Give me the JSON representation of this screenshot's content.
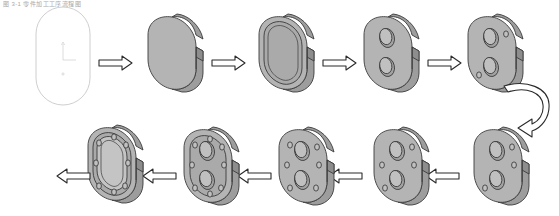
{
  "caption": {
    "text": "图 3-1 零件加工工序流程图"
  },
  "colors": {
    "face": "#b4b4b4",
    "face_light": "#c9c9c9",
    "side": "#9a9a9a",
    "side_dark": "#8a8a8a",
    "pocket": "#a8a8a8",
    "hole": "#bdbdbd",
    "outline": "#3a3a3a",
    "wireframe": "#c8c8c8",
    "arrow_fill": "#ffffff",
    "arrow_stroke": "#2b2b2b",
    "background": "#ffffff"
  },
  "diagram": {
    "type": "process-flow",
    "title": "零件加工工序流程图",
    "flow_direction": "serpentine-right-then-left",
    "step_count": 10,
    "rows": [
      {
        "name": "top-row",
        "direction": "left-to-right",
        "steps": [
          {
            "index": 1,
            "id": "step-sketch",
            "label": "毛坯草图轮廓",
            "kind": "wireframe-outline",
            "features": "stadium outline with datum axis marker"
          },
          {
            "index": 2,
            "id": "step-blank",
            "label": "拉伸成形坯料",
            "kind": "solid-extrusion",
            "features": "solid obround block"
          },
          {
            "index": 3,
            "id": "step-pocket",
            "label": "铣削内腔",
            "kind": "pocket",
            "features": "recessed inner obround pocket"
          },
          {
            "index": 4,
            "id": "step-two-bores",
            "label": "钻两大孔",
            "kind": "bored",
            "features": "two large through bores"
          },
          {
            "index": 5,
            "id": "step-two-small",
            "label": "钻两小孔",
            "kind": "bored-small",
            "features": "two large bores plus two small holes"
          }
        ]
      },
      {
        "name": "bottom-row",
        "direction": "right-to-left",
        "steps": [
          {
            "index": 6,
            "id": "step-three-small",
            "label": "增钻小孔",
            "kind": "bored-small",
            "features": "two large bores plus three small holes"
          },
          {
            "index": 7,
            "id": "step-four-small",
            "label": "钻四小孔",
            "kind": "bored-small",
            "features": "two large bores plus four small holes"
          },
          {
            "index": 8,
            "id": "step-six-small",
            "label": "钻六小孔",
            "kind": "bored-small",
            "features": "two large bores plus six small holes"
          },
          {
            "index": 9,
            "id": "step-ring-holes",
            "label": "钻周边孔系",
            "kind": "bored-ring",
            "features": "full perimeter hole pattern with raised boss"
          },
          {
            "index": 10,
            "id": "step-finished",
            "label": "成品零件",
            "kind": "finished",
            "features": "multi-level recessed pocket, finished part"
          }
        ]
      }
    ],
    "connectors": [
      {
        "id": "arrow-1-2",
        "from": 1,
        "to": 2,
        "direction": "right",
        "style": "hollow-block"
      },
      {
        "id": "arrow-2-3",
        "from": 2,
        "to": 3,
        "direction": "right",
        "style": "hollow-block"
      },
      {
        "id": "arrow-3-4",
        "from": 3,
        "to": 4,
        "direction": "right",
        "style": "hollow-block"
      },
      {
        "id": "arrow-4-5",
        "from": 4,
        "to": 5,
        "direction": "right",
        "style": "hollow-block"
      },
      {
        "id": "arrow-wrap",
        "from": 5,
        "to": 6,
        "direction": "wrap-down-left",
        "style": "hollow-curved"
      },
      {
        "id": "arrow-6-7",
        "from": 6,
        "to": 7,
        "direction": "left",
        "style": "hollow-block"
      },
      {
        "id": "arrow-7-8",
        "from": 7,
        "to": 8,
        "direction": "left",
        "style": "hollow-block"
      },
      {
        "id": "arrow-8-9",
        "from": 8,
        "to": 9,
        "direction": "left",
        "style": "hollow-block"
      },
      {
        "id": "arrow-9-10",
        "from": 9,
        "to": 10,
        "direction": "left",
        "style": "hollow-block"
      }
    ]
  }
}
